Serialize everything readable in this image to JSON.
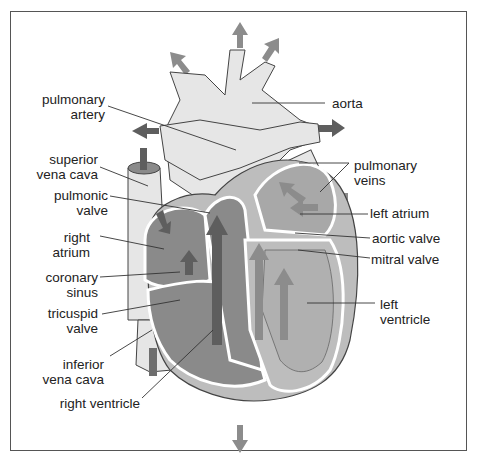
{
  "diagram": {
    "labels_left": [
      {
        "id": "pulmonary-artery",
        "line1": "pulmonary",
        "line2": "artery"
      },
      {
        "id": "superior-vena-cava",
        "line1": "superior",
        "line2": "vena cava"
      },
      {
        "id": "pulmonic-valve",
        "line1": "pulmonic",
        "line2": "valve"
      },
      {
        "id": "right-atrium",
        "line1": "right",
        "line2": "atrium"
      },
      {
        "id": "coronary-sinus",
        "line1": "coronary",
        "line2": "sinus"
      },
      {
        "id": "tricuspid-valve",
        "line1": "tricuspid",
        "line2": "valve"
      },
      {
        "id": "inferior-vena-cava",
        "line1": "inferior",
        "line2": "vena cava"
      },
      {
        "id": "right-ventricle",
        "line1": "right ventricle",
        "line2": ""
      }
    ],
    "labels_right": [
      {
        "id": "aorta",
        "line1": "aorta",
        "line2": ""
      },
      {
        "id": "pulmonary-veins",
        "line1": "pulmonary",
        "line2": "veins"
      },
      {
        "id": "left-atrium",
        "line1": "left atrium",
        "line2": ""
      },
      {
        "id": "aortic-valve",
        "line1": "aortic valve",
        "line2": ""
      },
      {
        "id": "mitral-valve",
        "line1": "mitral valve",
        "line2": ""
      },
      {
        "id": "left-ventricle",
        "line1": "left",
        "line2": "ventricle"
      }
    ],
    "colors": {
      "vessel_fill": "#e6e6e6",
      "chamber_dark": "#8a8a8a",
      "chamber_mid": "#a8a8a8",
      "arrow_dark": "#5e5e5e",
      "arrow_light": "#8c8c8c",
      "outline": "#444444",
      "border": "#555555"
    }
  }
}
